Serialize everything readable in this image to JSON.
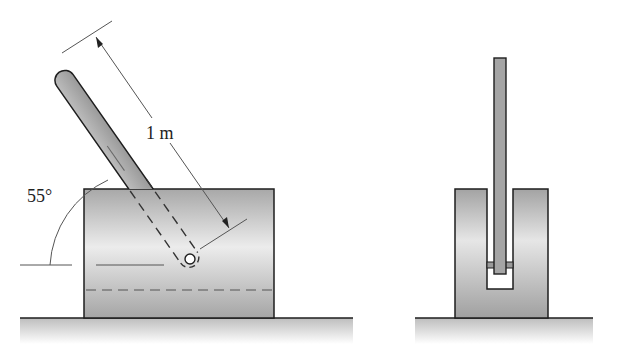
{
  "figure": {
    "side_view": {
      "angle_label": "55°",
      "length_label": "1 m"
    },
    "end_view": {}
  },
  "colors": {
    "outline": "#1e1e1e",
    "rod_fill": "#a9a9a9",
    "block_fill_light": "#e2e2e2",
    "block_fill_dark": "#9c9c9c",
    "ground": "#c9c9c9",
    "dimension": "#555555"
  }
}
